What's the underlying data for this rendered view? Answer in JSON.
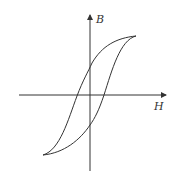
{
  "diagram": {
    "type": "hysteresis-loop",
    "axes": {
      "x_label": "H",
      "y_label": "B"
    },
    "colors": {
      "stroke": "#333333",
      "background": "#ffffff"
    }
  }
}
